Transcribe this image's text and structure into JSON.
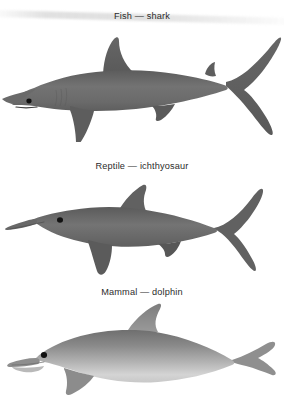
{
  "figure": {
    "background_color": "#ffffff",
    "body_color": "#6e6e6e",
    "body_color_dark": "#5a5a5a",
    "body_color_light": "#d9d9d9",
    "eye_color": "#111111",
    "caption_color": "#2b2b2b",
    "panels": [
      {
        "id": "shark",
        "caption": "Fish — shark",
        "group_label": "Fish",
        "species_label": "shark",
        "icon_name": "shark-silhouette",
        "orientation": "facing-left",
        "tail_type": "vertical crescent caudal fin",
        "snout": "blunt pointed",
        "has_dorsal_fin": true,
        "has_eye": true
      },
      {
        "id": "reptile",
        "caption": "Reptile — ichthyosaur",
        "group_label": "Reptile",
        "species_label": "ichthyosaur",
        "icon_name": "ichthyosaur-silhouette",
        "orientation": "facing-left",
        "tail_type": "vertical crescent caudal fin",
        "snout": "long narrow rostrum",
        "has_dorsal_fin": true,
        "has_eye": true
      },
      {
        "id": "mammal",
        "caption": "Mammal — dolphin",
        "group_label": "Mammal",
        "species_label": "dolphin",
        "icon_name": "dolphin-silhouette",
        "orientation": "facing-left",
        "tail_type": "horizontal flukes",
        "snout": "short beak with melon",
        "has_dorsal_fin": true,
        "has_eye": true
      }
    ]
  }
}
